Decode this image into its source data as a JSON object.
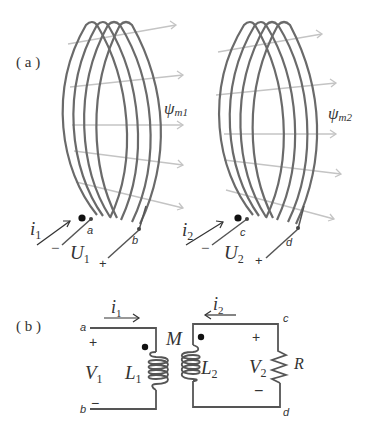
{
  "figure": {
    "part_a": {
      "label": "( a )",
      "coil1": {
        "flux_symbol": "ψ",
        "flux_subscript": "m1",
        "current_symbol": "i",
        "current_subscript": "1",
        "voltage_symbol": "U",
        "voltage_subscript": "1",
        "terminal_left": "a",
        "terminal_right": "b",
        "polarity_left": "−",
        "polarity_right": "+",
        "turns": 4,
        "flux_lines": 5
      },
      "coil2": {
        "flux_symbol": "ψ",
        "flux_subscript": "m2",
        "current_symbol": "i",
        "current_subscript": "2",
        "voltage_symbol": "U",
        "voltage_subscript": "2",
        "terminal_left": "c",
        "terminal_right": "d",
        "polarity_left": "−",
        "polarity_right": "+",
        "turns": 4,
        "flux_lines": 5
      }
    },
    "part_b": {
      "label": "( b )",
      "mutual_inductance": "M",
      "primary": {
        "terminal_top": "a",
        "terminal_bottom": "b",
        "current_symbol": "i",
        "current_subscript": "1",
        "voltage_symbol": "V",
        "voltage_subscript": "1",
        "polarity_top": "+",
        "polarity_bottom": "−",
        "inductor_symbol": "L",
        "inductor_subscript": "1"
      },
      "secondary": {
        "terminal_top": "c",
        "terminal_bottom": "d",
        "current_symbol": "i",
        "current_subscript": "2",
        "voltage_symbol": "V",
        "voltage_subscript": "2",
        "polarity_top": "+",
        "polarity_bottom": "−",
        "inductor_symbol": "L",
        "inductor_subscript": "2",
        "load_symbol": "R"
      }
    }
  },
  "colors": {
    "coil": "#6a6a6a",
    "flux": "#c4c4c4",
    "wire": "#555555",
    "text": "#333333",
    "dot": "#111111"
  }
}
